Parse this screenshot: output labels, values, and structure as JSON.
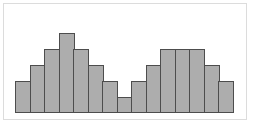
{
  "window": {
    "title": "",
    "description": "Bordered white figure panel containing an unlabeled bimodal histogram"
  },
  "colors": {
    "page_bg": "#ffffff",
    "panel_bg": "#ffffff",
    "panel_border": "#dcdcdc",
    "bar_fill": "#adadad",
    "bar_border": "#4d4d4d"
  },
  "chart_data": {
    "type": "bar",
    "subtype": "histogram",
    "title": "",
    "xlabel": "",
    "ylabel": "",
    "categories": [
      "",
      "",
      "",
      "",
      "",
      "",
      "",
      "",
      "",
      "",
      "",
      "",
      "",
      "",
      ""
    ],
    "values": [
      2,
      3,
      4,
      5,
      4,
      3,
      2,
      1,
      2,
      3,
      4,
      4,
      4,
      3,
      2
    ],
    "ylim": [
      0,
      5
    ],
    "unit_height_px": 16,
    "bar_width_px": 16,
    "gap_px": 0,
    "grid": false,
    "axes_visible": false,
    "tick_labels_visible": false,
    "legend": false,
    "legend_position": "none",
    "annotations": []
  }
}
